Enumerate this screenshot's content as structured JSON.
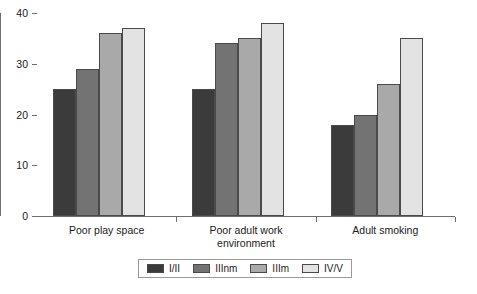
{
  "chart_data": {
    "type": "bar",
    "title": "",
    "subtitle": "",
    "xlabel": "",
    "ylabel": "",
    "ylim": [
      0,
      40
    ],
    "yticks": [
      0,
      10,
      20,
      30,
      40
    ],
    "grid": false,
    "legend_position": "bottom",
    "categories": [
      "Poor play space",
      "Poor adult work\nenvironment",
      "Adult smoking"
    ],
    "series": [
      {
        "name": "I/II",
        "color": "#3b3b3b",
        "values": [
          25,
          25,
          18
        ]
      },
      {
        "name": "IIInm",
        "color": "#737373",
        "values": [
          29,
          34,
          20
        ]
      },
      {
        "name": "IIIm",
        "color": "#a9a9a9",
        "values": [
          36,
          35,
          26
        ]
      },
      {
        "name": "IV/V",
        "color": "#e3e3e3",
        "values": [
          37,
          38,
          35
        ]
      }
    ]
  },
  "axes": {
    "y_tick_labels": [
      "0",
      "10",
      "20",
      "30",
      "40"
    ],
    "axis_color": "#6e6e6e",
    "bar_outline_color": "#4a4a4a"
  },
  "legend": {
    "entries": [
      "I/II",
      "IIInm",
      "IIIm",
      "IV/V"
    ]
  }
}
